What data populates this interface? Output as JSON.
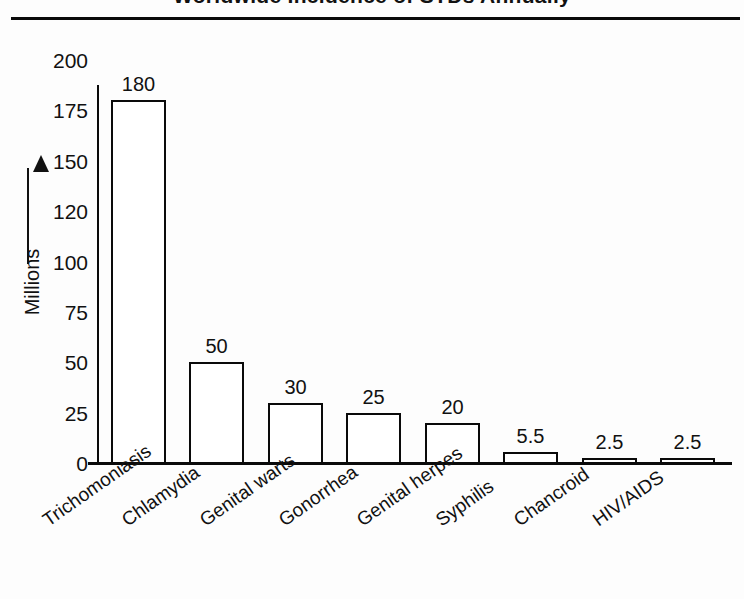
{
  "figure": {
    "title": "Worldwide Incidence of STDs Annually",
    "y_axis_label": "Millions",
    "arrow_icon": "up-arrow-icon"
  },
  "chart_data": {
    "type": "bar",
    "title": "Worldwide Incidence of STDs Annually",
    "xlabel": "",
    "ylabel": "Millions",
    "ylim": [
      0,
      200
    ],
    "grid": false,
    "legend": "none",
    "categories": [
      "Trichomoniasis",
      "Chlamydia",
      "Genital warts",
      "Gonorrhea",
      "Genital herpes",
      "Syphilis",
      "Chancroid",
      "HIV/AIDS"
    ],
    "values": [
      180,
      50,
      30,
      25,
      20,
      5.5,
      2.5,
      2.5
    ],
    "value_labels": [
      "180",
      "50",
      "30",
      "25",
      "20",
      "5.5",
      "2.5",
      "2.5"
    ],
    "ytick_labels": [
      "200",
      "175",
      "150",
      "120",
      "100",
      "75",
      "50",
      "25",
      "0"
    ],
    "ytick_values": [
      200,
      175,
      150,
      120,
      100,
      75,
      50,
      25,
      0
    ],
    "ytick_note": "Tick labels are drawn at equal vertical spacing although the numeric steps are uneven (120 appears between 100 and 150).",
    "colors": {
      "bar_fill": "#ffffff",
      "bar_stroke": "#0a0a0a",
      "axis": "#0a0a0a",
      "text": "#111111",
      "background": "#fdfdfd"
    }
  }
}
